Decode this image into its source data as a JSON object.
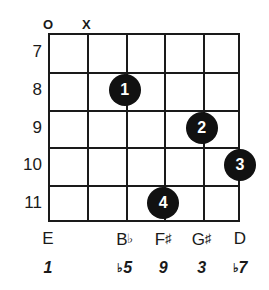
{
  "diagram": {
    "type": "guitar-chord-diagram",
    "instrument": "guitar",
    "string_count": 6,
    "fret_numbers": [
      "7",
      "8",
      "9",
      "10",
      "11"
    ],
    "open_marker": "O",
    "muted_marker": "X",
    "string_markers": [
      {
        "string": 1,
        "marker": "O",
        "meaning": "open"
      },
      {
        "string": 2,
        "marker": "X",
        "meaning": "muted"
      }
    ],
    "dots": [
      {
        "label": "1",
        "string": 3,
        "fret": "8"
      },
      {
        "label": "2",
        "string": 5,
        "fret": "9"
      },
      {
        "label": "3",
        "string": 6,
        "fret": "10"
      },
      {
        "label": "4",
        "string": 4,
        "fret": "11"
      }
    ],
    "notes": [
      {
        "string": 1,
        "note": "E",
        "accidental": "",
        "interval": "1",
        "interval_accidental": ""
      },
      {
        "string": 2,
        "note": "",
        "accidental": "",
        "interval": "",
        "interval_accidental": ""
      },
      {
        "string": 3,
        "note": "B",
        "accidental": "♭",
        "interval": "5",
        "interval_accidental": "♭"
      },
      {
        "string": 4,
        "note": "F",
        "accidental": "♯",
        "interval": "9",
        "interval_accidental": ""
      },
      {
        "string": 5,
        "note": "G",
        "accidental": "♯",
        "interval": "3",
        "interval_accidental": ""
      },
      {
        "string": 6,
        "note": "D",
        "accidental": "",
        "interval": "7",
        "interval_accidental": "♭"
      }
    ],
    "colors": {
      "ink": "#1a1a1a",
      "dot_fill": "#111111",
      "dot_text": "#ffffff",
      "background": "#ffffff"
    }
  }
}
